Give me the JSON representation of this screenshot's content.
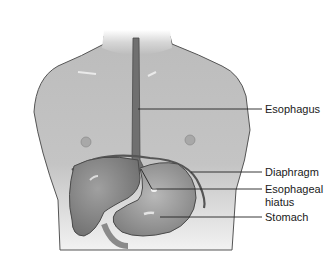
{
  "diagram": {
    "colors": {
      "skin": "#b4b4b4",
      "skin_light": "#d8d8d8",
      "organ": "#8a8a8a",
      "organ_dark": "#5a5a5a",
      "outline": "#4a4a4a",
      "esophagus": "#6a6a6a",
      "leader_line": "#222222",
      "text": "#1a1a1a",
      "background": "#ffffff"
    },
    "labels": [
      {
        "id": "esophagus",
        "text": "Esophagus"
      },
      {
        "id": "diaphragm",
        "text": "Diaphragm"
      },
      {
        "id": "hiatus_line1",
        "text": "Esophageal"
      },
      {
        "id": "hiatus_line2",
        "text": "hiatus"
      },
      {
        "id": "stomach",
        "text": "Stomach"
      }
    ]
  }
}
